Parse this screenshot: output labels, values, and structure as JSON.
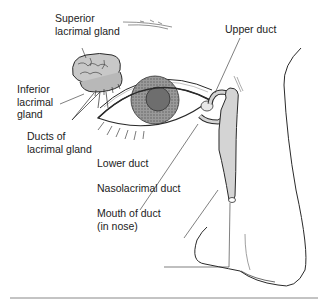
{
  "diagram": {
    "labels": {
      "superior_gland": "Superior\nlacrimal gland",
      "inferior_gland": "Inferior\nlacrimal\ngland",
      "ducts": "Ducts of\nlacrimal gland",
      "upper_duct": "Upper duct",
      "lower_duct": "Lower duct",
      "nasolacrimal_duct": "Nasolacrimal duct",
      "mouth_of_duct": "Mouth of duct\n(in nose)"
    },
    "colors": {
      "line": "#2a2a2a",
      "duct_fill": "#d4d4d4",
      "iris": "#8a8a8a",
      "pupil": "#6e6e6e",
      "gland_fill": "#c8c8c8",
      "rule": "#888888"
    }
  }
}
